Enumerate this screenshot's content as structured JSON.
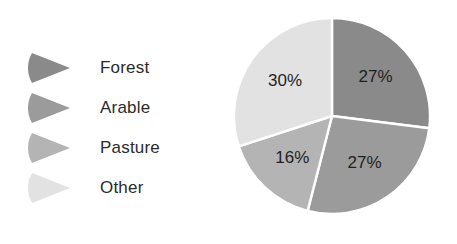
{
  "chart_data": {
    "type": "pie",
    "title": "",
    "categories": [
      "Forest",
      "Arable",
      "Pasture",
      "Other"
    ],
    "values": [
      27,
      27,
      16,
      30
    ],
    "value_labels": [
      "27%",
      "27%",
      "16%",
      "30%"
    ],
    "unit": "%",
    "start_angle_deg": 0,
    "direction": "clockwise",
    "legend": {
      "position": "left",
      "marker_shape": "wedge",
      "entries": [
        {
          "label": "Forest",
          "value_label": "27%",
          "color": "#8a8a8a"
        },
        {
          "label": "Arable",
          "value_label": "27%",
          "color": "#9b9b9b"
        },
        {
          "label": "Pasture",
          "value_label": "16%",
          "color": "#b4b4b4"
        },
        {
          "label": "Other",
          "value_label": "30%",
          "color": "#e2e2e2"
        }
      ]
    },
    "colors": [
      "#8a8a8a",
      "#9b9b9b",
      "#b4b4b4",
      "#e2e2e2"
    ],
    "separator_color": "#ffffff",
    "background_color": "#ffffff",
    "label_color": "#1f1f1f",
    "grid": false,
    "xlabel": "",
    "ylabel": ""
  },
  "legend": {
    "items": [
      {
        "label": "Forest"
      },
      {
        "label": "Arable"
      },
      {
        "label": "Pasture"
      },
      {
        "label": "Other"
      }
    ]
  },
  "pie": {
    "slices": [
      {
        "name": "Forest",
        "label": "27%"
      },
      {
        "name": "Arable",
        "label": "27%"
      },
      {
        "name": "Pasture",
        "label": "16%"
      },
      {
        "name": "Other",
        "label": "30%"
      }
    ]
  }
}
